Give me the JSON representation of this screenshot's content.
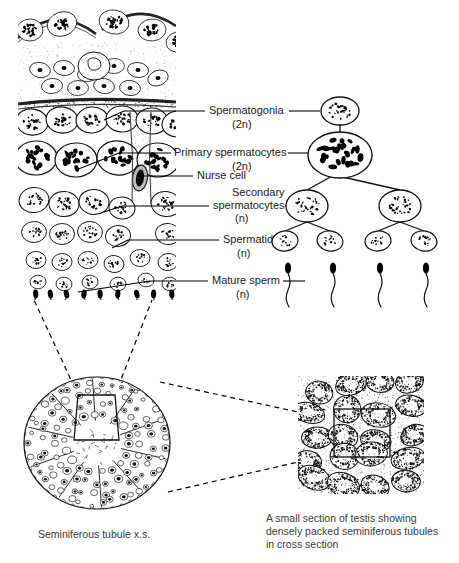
{
  "figure": {
    "title_absent": true,
    "background": "#ffffff",
    "ink": "#000000"
  },
  "labels": [
    {
      "id": "spermatogonia",
      "name": "Spermatogonia",
      "ploidy": "(2n)",
      "text_x": 209,
      "text_y": 114,
      "ploidy_x": 232,
      "ploidy_y": 128,
      "left_line": {
        "x1": 124,
        "y1": 111,
        "x2": 205,
        "y2": 111
      },
      "right_line": {
        "x1": 289,
        "y1": 111,
        "x2": 320,
        "y2": 111
      }
    },
    {
      "id": "primary-spermatocytes",
      "name": "Primary spermatocytes",
      "ploidy": "(2n)",
      "text_x": 174,
      "text_y": 156,
      "ploidy_x": 232,
      "ploidy_y": 170,
      "left_line": {
        "x1": 119,
        "y1": 153,
        "x2": 171,
        "y2": 153
      },
      "right_line": {
        "x1": 288,
        "y1": 153,
        "x2": 315,
        "y2": 153
      }
    },
    {
      "id": "nurse-cell",
      "name": "Nurse cell",
      "ploidy": "",
      "text_x": 197,
      "text_y": 179,
      "left_line": {
        "x1": 140,
        "y1": 176,
        "x2": 193,
        "y2": 176
      },
      "right_line": null
    },
    {
      "id": "secondary-spermatocytes",
      "name": "Secondary",
      "name2": "spermatocytes",
      "ploidy": "(n)",
      "text_x": 232,
      "text_y": 196,
      "text2_x": 213,
      "text2_y": 209,
      "ploidy_x": 235,
      "ploidy_y": 222,
      "left_line": {
        "x1": 122,
        "y1": 206,
        "x2": 209,
        "y2": 206
      },
      "right_line": {
        "x1": 285,
        "y1": 206,
        "x2": 296,
        "y2": 206
      }
    },
    {
      "id": "spermatids",
      "name": "Spermatids",
      "ploidy": "(n)",
      "text_x": 223,
      "text_y": 243,
      "ploidy_x": 237,
      "ploidy_y": 257,
      "left_line": {
        "x1": 128,
        "y1": 240,
        "x2": 219,
        "y2": 240
      },
      "right_line": {
        "x1": 281,
        "y1": 240,
        "x2": 297,
        "y2": 240
      }
    },
    {
      "id": "mature-sperm",
      "name": "Mature sperm",
      "ploidy": "(n)",
      "text_x": 212,
      "text_y": 284,
      "ploidy_x": 236,
      "ploidy_y": 298,
      "left_line": {
        "x1": 150,
        "y1": 281,
        "x2": 208,
        "y2": 281
      },
      "right_line": {
        "x1": 283,
        "y1": 281,
        "x2": 305,
        "y2": 281
      }
    }
  ],
  "lineage": {
    "spermatogonium": {
      "cx": 340,
      "cy": 111,
      "rx": 19,
      "ry": 14
    },
    "primary_spermatocyte": {
      "cx": 340,
      "cy": 155,
      "rx": 32,
      "ry": 23
    },
    "secondary_spermatocytes": [
      {
        "cx": 307,
        "cy": 206,
        "rx": 21,
        "ry": 16
      },
      {
        "cx": 400,
        "cy": 206,
        "rx": 21,
        "ry": 16
      }
    ],
    "spermatids": [
      {
        "cx": 285,
        "cy": 241,
        "rx": 13,
        "ry": 10
      },
      {
        "cx": 330,
        "cy": 241,
        "rx": 13,
        "ry": 10
      },
      {
        "cx": 378,
        "cy": 241,
        "rx": 13,
        "ry": 10
      },
      {
        "cx": 424,
        "cy": 241,
        "rx": 13,
        "ry": 10
      }
    ],
    "mature_sperm": [
      {
        "x": 288,
        "y": 268
      },
      {
        "x": 333,
        "y": 268
      },
      {
        "x": 380,
        "y": 268
      },
      {
        "x": 426,
        "y": 268
      }
    ]
  },
  "panels": {
    "tissue_detail": {
      "x": 18,
      "y": 8,
      "w": 158,
      "h": 292
    },
    "tubule_cross_section": {
      "cx": 97,
      "cy": 443,
      "rx": 73,
      "ry": 66
    },
    "testis_inset": {
      "x": 298,
      "y": 376,
      "w": 126,
      "h": 118
    }
  },
  "captions": {
    "left": {
      "text": "Seminiferous tubule x.s.",
      "x": 38,
      "y": 538
    },
    "right": {
      "line1": "A small section of testis showing",
      "line2": "densely packed seminiferous tubules",
      "line3": "in cross section",
      "x": 266,
      "y": 522
    }
  },
  "callouts": {
    "wedge_to_detail": [
      {
        "x1": 78,
        "y1": 395,
        "x2": 34,
        "y2": 300
      },
      {
        "x1": 115,
        "y1": 395,
        "x2": 152,
        "y2": 300
      }
    ],
    "circle_to_inset": [
      {
        "x1": 160,
        "y1": 382,
        "x2": 298,
        "y2": 412
      },
      {
        "x1": 168,
        "y1": 492,
        "x2": 298,
        "y2": 462
      }
    ]
  }
}
